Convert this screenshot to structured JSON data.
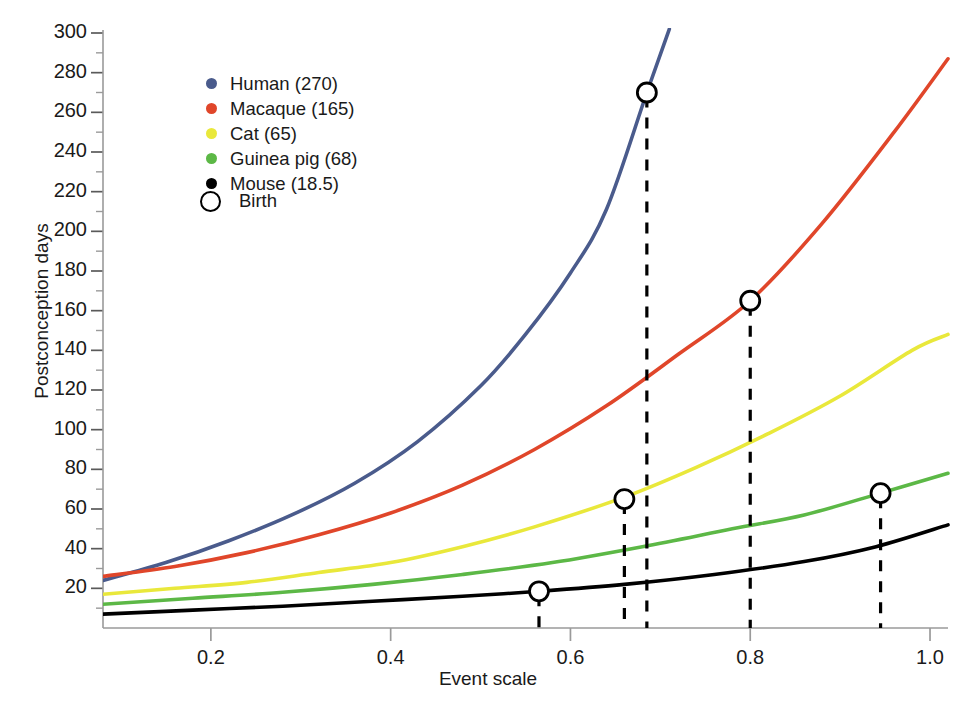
{
  "chart_data": {
    "type": "line",
    "title": "",
    "xlabel": "Event scale",
    "ylabel": "Postconception days",
    "xlim": [
      0.08,
      1.02
    ],
    "ylim": [
      0,
      300
    ],
    "grid": false,
    "legend_position": "upper-left",
    "xticks": [
      0.2,
      0.4,
      0.6,
      0.8,
      1.0
    ],
    "xtick_labels": [
      "0.2",
      "0.4",
      "0.6",
      "0.8",
      "1.0"
    ],
    "yticks": [
      20,
      40,
      60,
      80,
      100,
      120,
      140,
      160,
      180,
      200,
      220,
      240,
      260,
      280,
      300
    ],
    "ytick_labels": [
      "20",
      "40",
      "60",
      "80",
      "100",
      "120",
      "140",
      "160",
      "180",
      "200",
      "220",
      "240",
      "260",
      "280",
      "300"
    ],
    "y_minor_tick_step": 10,
    "series": [
      {
        "name": "Human",
        "legend_label": "Human (270)",
        "color": "#4a5b8c",
        "birth_days": 270,
        "birth_event_scale": 0.685,
        "x": [
          0.08,
          0.15,
          0.22,
          0.29,
          0.36,
          0.43,
          0.5,
          0.55,
          0.6,
          0.64,
          0.685,
          0.71
        ],
        "y": [
          24,
          33,
          44,
          57,
          73,
          94,
          122,
          148,
          179,
          211,
          270,
          302
        ]
      },
      {
        "name": "Macaque",
        "legend_label": "Macaque (165)",
        "color": "#e0462a",
        "birth_days": 165,
        "birth_event_scale": 0.8,
        "x": [
          0.08,
          0.16,
          0.24,
          0.32,
          0.4,
          0.48,
          0.56,
          0.64,
          0.72,
          0.8,
          0.88,
          0.96,
          1.02
        ],
        "y": [
          26,
          31,
          38,
          47,
          58,
          72,
          90,
          112,
          138,
          165,
          204,
          250,
          287
        ]
      },
      {
        "name": "Cat",
        "legend_label": "Cat (65)",
        "color": "#e9e83b",
        "birth_days": 65,
        "birth_event_scale": 0.66,
        "x": [
          0.08,
          0.16,
          0.24,
          0.32,
          0.4,
          0.48,
          0.56,
          0.66,
          0.74,
          0.82,
          0.9,
          0.98,
          1.02
        ],
        "y": [
          17,
          20,
          23,
          28,
          33,
          41,
          51,
          66,
          81,
          98,
          117,
          140,
          148
        ]
      },
      {
        "name": "Guinea pig",
        "legend_label": "Guinea pig (68)",
        "color": "#5cb846",
        "birth_days": 68,
        "birth_event_scale": 0.945,
        "x": [
          0.08,
          0.18,
          0.28,
          0.38,
          0.48,
          0.58,
          0.68,
          0.78,
          0.86,
          0.945,
          1.02
        ],
        "y": [
          12,
          15,
          18,
          22,
          27,
          33,
          41,
          50,
          57,
          68,
          78
        ]
      },
      {
        "name": "Mouse",
        "legend_label": "Mouse (18.5)",
        "color": "#000000",
        "birth_days": 18.5,
        "birth_event_scale": 0.565,
        "x": [
          0.08,
          0.18,
          0.28,
          0.38,
          0.48,
          0.565,
          0.66,
          0.76,
          0.86,
          0.94,
          1.02
        ],
        "y": [
          7,
          9,
          11,
          13.5,
          16,
          18.5,
          22,
          27,
          33.5,
          41,
          52
        ]
      }
    ],
    "markers": {
      "label": "Birth",
      "shape": "open-circle",
      "points": [
        {
          "series": "Human",
          "x": 0.685,
          "y": 270
        },
        {
          "series": "Macaque",
          "x": 0.8,
          "y": 165
        },
        {
          "series": "Cat",
          "x": 0.66,
          "y": 65
        },
        {
          "series": "Guinea pig",
          "x": 0.945,
          "y": 68
        },
        {
          "series": "Mouse",
          "x": 0.565,
          "y": 18.5
        }
      ]
    }
  },
  "legend": {
    "birth_label": "Birth"
  },
  "artifact": {
    "top_text": ""
  }
}
